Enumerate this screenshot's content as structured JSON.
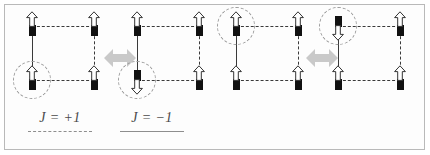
{
  "figure": {
    "background_color": "#fdfdfd",
    "border_color": "#b9b9b9",
    "bond_color": "#3a3a3a",
    "spin_color": "#111111",
    "circle_color": "#9a9a9a",
    "flip_arrow_color": "#c9c9c9"
  },
  "legend": {
    "items": [
      {
        "label": "J = +1",
        "line_style": "dashed",
        "line_color": "#8e8e8e"
      },
      {
        "label": "J = −1",
        "line_style": "solid",
        "line_color": "#8e8e8e"
      }
    ]
  },
  "plaquettes": [
    {
      "id": "plaquette-1",
      "group": "left-pair",
      "role": "initial-state",
      "edges": {
        "top": "dashed",
        "right": "dashed",
        "bottom": "dashed",
        "left": "solid"
      },
      "spins": {
        "top_left": "up",
        "top_right": "up",
        "bottom_left": "up",
        "bottom_right": "up"
      },
      "highlight_site": "bottom_left"
    },
    {
      "id": "plaquette-2",
      "group": "left-pair",
      "role": "flipped-state",
      "edges": {
        "top": "dashed",
        "right": "dashed",
        "bottom": "dashed",
        "left": "solid"
      },
      "spins": {
        "top_left": "up",
        "top_right": "up",
        "bottom_left": "down",
        "bottom_right": "up"
      },
      "highlight_site": "bottom_left"
    },
    {
      "id": "plaquette-3",
      "group": "right-pair",
      "role": "initial-state",
      "edges": {
        "top": "dashed",
        "right": "dashed",
        "bottom": "dashed",
        "left": "solid"
      },
      "spins": {
        "top_left": "up",
        "top_right": "up",
        "bottom_left": "up",
        "bottom_right": "up"
      },
      "highlight_site": "top_left"
    },
    {
      "id": "plaquette-4",
      "group": "right-pair",
      "role": "flipped-state",
      "edges": {
        "top": "dashed",
        "right": "dashed",
        "bottom": "dashed",
        "left": "solid"
      },
      "spins": {
        "top_left": "down",
        "top_right": "up",
        "bottom_left": "up",
        "bottom_right": "up"
      },
      "highlight_site": "top_left"
    }
  ],
  "flip_arrows": [
    {
      "id": "flip-arrow-left",
      "direction": "double-horizontal",
      "between": "plaquette-1 and plaquette-2"
    },
    {
      "id": "flip-arrow-right",
      "direction": "double-horizontal",
      "between": "plaquette-3 and plaquette-4"
    }
  ]
}
